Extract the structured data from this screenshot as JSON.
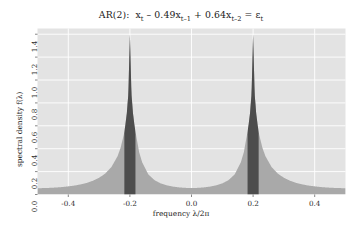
{
  "chart_data": {
    "type": "area",
    "title_parts": {
      "model": "AR(2)",
      "colon": ":",
      "x_main": "x",
      "x_main_sub": "t",
      "term1_op": "– 0.49x",
      "term1_sub": "t–1",
      "term2_op": "+ 0.64x",
      "term2_sub": "t–2",
      "equals": "= ε",
      "equals_sub": "t"
    },
    "xlabel": "frequency λ/2π",
    "ylabel": "spectral density f(λ)",
    "xlim": [
      -0.5,
      0.5
    ],
    "ylim": [
      0.0,
      1.45
    ],
    "xticks": [
      -0.4,
      -0.2,
      0.0,
      0.2,
      0.4
    ],
    "xtick_labels": [
      "-0.4",
      "-0.2",
      "0.0",
      "0.2",
      "0.4"
    ],
    "yticks": [
      0.0,
      0.2,
      0.4,
      0.6,
      0.8,
      1.0,
      1.2,
      1.4
    ],
    "ytick_labels": [
      "0.0",
      "0.2",
      "0.4",
      "0.6",
      "0.8",
      "1.0",
      "1.2",
      "1.4"
    ],
    "grid": true,
    "grid_color": "#ffffff",
    "panel_color": "#e3e3e3",
    "fill_color": "#a9a9a9",
    "highlight_color": "#4d4d4d",
    "ar_coefficients": [
      0.49,
      -0.64
    ],
    "peak_frequencies": [
      -0.2,
      0.2
    ],
    "peak_value": 1.4,
    "highlight_bands": [
      {
        "from": -0.218,
        "to": -0.182
      },
      {
        "from": 0.182,
        "to": 0.218
      }
    ],
    "x": [
      -0.5,
      -0.48,
      -0.46,
      -0.44,
      -0.42,
      -0.4,
      -0.38,
      -0.36,
      -0.34,
      -0.32,
      -0.3,
      -0.28,
      -0.26,
      -0.24,
      -0.23,
      -0.22,
      -0.215,
      -0.21,
      -0.205,
      -0.2,
      -0.195,
      -0.19,
      -0.185,
      -0.18,
      -0.17,
      -0.16,
      -0.14,
      -0.12,
      -0.1,
      -0.08,
      -0.06,
      -0.04,
      -0.02,
      0.0,
      0.02,
      0.04,
      0.06,
      0.08,
      0.1,
      0.12,
      0.14,
      0.16,
      0.17,
      0.18,
      0.185,
      0.19,
      0.195,
      0.2,
      0.205,
      0.21,
      0.215,
      0.22,
      0.23,
      0.24,
      0.26,
      0.28,
      0.3,
      0.32,
      0.34,
      0.36,
      0.38,
      0.4,
      0.42,
      0.44,
      0.46,
      0.48,
      0.5
    ],
    "y": [
      0.055,
      0.056,
      0.058,
      0.061,
      0.065,
      0.071,
      0.078,
      0.088,
      0.101,
      0.12,
      0.146,
      0.183,
      0.24,
      0.335,
      0.41,
      0.52,
      0.6,
      0.71,
      0.88,
      1.4,
      0.88,
      0.71,
      0.6,
      0.52,
      0.37,
      0.28,
      0.175,
      0.125,
      0.097,
      0.08,
      0.069,
      0.062,
      0.058,
      0.056,
      0.058,
      0.062,
      0.069,
      0.08,
      0.097,
      0.125,
      0.175,
      0.28,
      0.37,
      0.52,
      0.6,
      0.71,
      0.88,
      1.4,
      0.88,
      0.71,
      0.6,
      0.52,
      0.41,
      0.335,
      0.24,
      0.183,
      0.146,
      0.12,
      0.101,
      0.088,
      0.078,
      0.071,
      0.065,
      0.061,
      0.058,
      0.056,
      0.055
    ]
  }
}
